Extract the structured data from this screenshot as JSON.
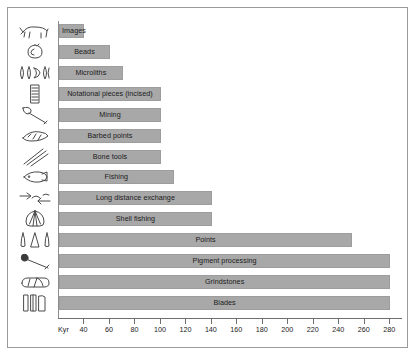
{
  "chart_data": {
    "type": "bar",
    "orientation": "horizontal",
    "title": "",
    "xlabel": "Kyr",
    "ylabel": "",
    "xlim": [
      20,
      290
    ],
    "grid": false,
    "legend": null,
    "axis_origin_label": "Kyr",
    "tick_labels": [
      "40",
      "60",
      "80",
      "100",
      "120",
      "140",
      "160",
      "180",
      "200",
      "220",
      "240",
      "260",
      "280"
    ],
    "tick_values": [
      40,
      60,
      80,
      100,
      120,
      140,
      160,
      180,
      200,
      220,
      240,
      260,
      280
    ],
    "bar_color": "#a8a8a8",
    "categories": [
      "Images",
      "Beads",
      "Microliths",
      "Notational pieces (incised)",
      "Mining",
      "Barbed points",
      "Bone tools",
      "Fishing",
      "Long distance exchange",
      "Shell fishing",
      "Points",
      "Pigment processing",
      "Grindstones",
      "Blades"
    ],
    "values": [
      40,
      60,
      70,
      100,
      100,
      100,
      100,
      110,
      140,
      140,
      250,
      280,
      280,
      280
    ],
    "icons": [
      "animal-figure-icon",
      "bead-icon",
      "microliths-icon",
      "notched-bone-icon",
      "mining-pick-icon",
      "barbed-point-icon",
      "bone-tools-icon",
      "fish-icon",
      "exchange-arrows-icon",
      "shell-icon",
      "stone-points-icon",
      "hafted-pigment-tool-icon",
      "grindstone-icon",
      "blades-icon"
    ],
    "label_align": [
      "leftish",
      "centered",
      "centered",
      "centered",
      "centered",
      "centered",
      "centered",
      "centered",
      "centered",
      "centered",
      "centered",
      "centered",
      "centered",
      "centered"
    ]
  }
}
